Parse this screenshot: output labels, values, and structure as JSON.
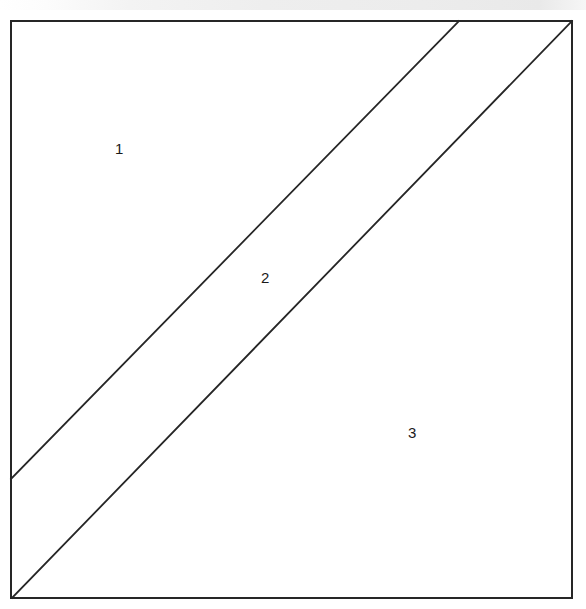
{
  "figure": {
    "background_color": "#ffffff",
    "top_strip": {
      "name": "top-grey-strip",
      "color": "#ececec",
      "height_px": 10
    },
    "stroke_color": "#262626",
    "stroke_width_px": 2,
    "square": {
      "left": 11,
      "top": 21,
      "right": 572,
      "bottom": 598
    },
    "diagonals": [
      {
        "name": "upper-diagonal",
        "x1": 11,
        "y1": 479,
        "x2": 459,
        "y2": 21
      },
      {
        "name": "lower-diagonal",
        "x1": 12,
        "y1": 598,
        "x2": 572,
        "y2": 21
      }
    ],
    "region_labels": [
      {
        "id": "1",
        "text": "1",
        "x": 115,
        "y": 141
      },
      {
        "id": "2",
        "text": "2",
        "x": 261,
        "y": 270
      },
      {
        "id": "3",
        "text": "3",
        "x": 408,
        "y": 425
      }
    ]
  }
}
